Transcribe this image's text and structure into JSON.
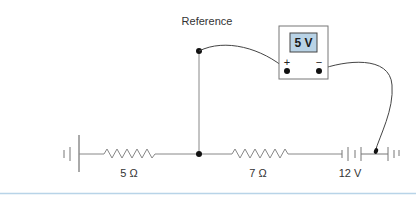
{
  "diagram": {
    "reference_label": "Reference",
    "meter": {
      "reading": "5 V",
      "plus_label": "+",
      "minus_label": "−",
      "display_color": "#b9d3e6"
    },
    "components": [
      {
        "type": "resistor",
        "label": "5 Ω"
      },
      {
        "type": "resistor",
        "label": "7 Ω"
      },
      {
        "type": "battery",
        "label": "12 V"
      }
    ],
    "footer_rule_color": "#b8d4e8"
  }
}
